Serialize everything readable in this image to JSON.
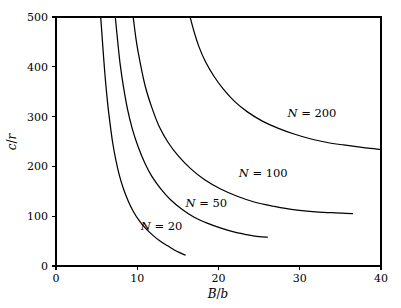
{
  "chart_data": {
    "type": "line",
    "title": "",
    "subtitle": "",
    "xlabel": "B/b",
    "ylabel": "c/r",
    "xlim": [
      0,
      40
    ],
    "ylim": [
      0,
      500
    ],
    "xticks": [
      0,
      10,
      20,
      30,
      40
    ],
    "yticks": [
      0,
      100,
      200,
      300,
      400,
      500
    ],
    "xticklabels": [
      "0",
      "10",
      "20",
      "30",
      "40"
    ],
    "yticklabels": [
      "0",
      "100",
      "200",
      "300",
      "400",
      "500"
    ],
    "grid": false,
    "legend_position": "inline-annotations",
    "annotations": [
      {
        "text": "N = 200",
        "x": 31.5,
        "y": 300
      },
      {
        "text": "N = 100",
        "x": 25.5,
        "y": 178
      },
      {
        "text": "N = 50",
        "x": 18.5,
        "y": 118
      },
      {
        "text": "N = 20",
        "x": 13.0,
        "y": 73
      }
    ],
    "series": [
      {
        "name": "N = 20",
        "label": "N = 20",
        "x": [
          5.5,
          5.7,
          5.9,
          6.1,
          6.4,
          6.7,
          7.0,
          7.4,
          7.8,
          8.3,
          8.9,
          9.5,
          10.2,
          11.0,
          11.9,
          12.8,
          13.8,
          14.8,
          15.9
        ],
        "y": [
          500,
          455,
          410,
          370,
          320,
          280,
          245,
          210,
          182,
          155,
          130,
          110,
          92,
          76,
          62,
          50,
          40,
          30,
          22
        ]
      },
      {
        "name": "N = 50",
        "label": "N = 50",
        "x": [
          7.3,
          7.6,
          7.9,
          8.3,
          8.8,
          9.4,
          10.1,
          10.9,
          11.8,
          12.9,
          14.1,
          15.5,
          17.0,
          18.6,
          20.3,
          22.0,
          23.8,
          25.0,
          26.0
        ],
        "y": [
          500,
          450,
          405,
          360,
          315,
          275,
          240,
          208,
          180,
          155,
          133,
          114,
          98,
          86,
          76,
          68,
          62,
          59,
          58
        ]
      },
      {
        "name": "N = 100",
        "label": "N = 100",
        "x": [
          9.5,
          9.9,
          10.4,
          11.0,
          11.8,
          12.7,
          13.8,
          15.1,
          16.6,
          18.3,
          20.2,
          22.3,
          24.5,
          26.8,
          29.2,
          31.6,
          33.9,
          35.3,
          36.5
        ],
        "y": [
          500,
          450,
          405,
          360,
          318,
          280,
          248,
          220,
          195,
          173,
          155,
          140,
          128,
          120,
          113,
          109,
          107,
          106,
          105
        ]
      },
      {
        "name": "N = 200",
        "label": "N = 200",
        "x": [
          16.5,
          17.0,
          17.6,
          18.4,
          19.4,
          20.6,
          22.0,
          23.6,
          25.4,
          27.3,
          29.3,
          31.4,
          33.4,
          35.4,
          37.2,
          38.7,
          40.0
        ],
        "y": [
          500,
          470,
          440,
          410,
          382,
          355,
          330,
          309,
          291,
          277,
          265,
          255,
          248,
          243,
          239,
          236,
          234
        ]
      }
    ]
  },
  "axes": {
    "x_title": "B/b",
    "y_title": "c/r"
  }
}
